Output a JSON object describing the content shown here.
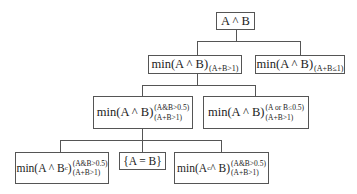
{
  "diagram": {
    "type": "tree",
    "root": {
      "id": "n0",
      "label": "A ^ B"
    },
    "nodes": [
      {
        "id": "n0",
        "main": "A ^ B",
        "sup": "",
        "sub": "",
        "parent": null
      },
      {
        "id": "n1",
        "main": "min(A ^ B)",
        "sup": "",
        "sub": "(A+B>1)",
        "parent": "n0"
      },
      {
        "id": "n2",
        "main": "min(A ^ B)",
        "sup": "",
        "sub": "(A+B≤1)",
        "parent": "n0"
      },
      {
        "id": "n3",
        "main": "min(A ^ B)",
        "sup": "(A&B>0.5)",
        "sub": "(A+B>1)",
        "parent": "n1"
      },
      {
        "id": "n4",
        "main": "min(A ^ B)",
        "sup": "(A or B≤0.5)",
        "sub": "(A+B>1)",
        "parent": "n1"
      },
      {
        "id": "n5",
        "main": "min(A ^ B",
        "main_sup_inline": "c",
        "main_close": ")",
        "sup": "(A&B>0.5)",
        "sub": "(A+B>1)",
        "parent": "n3"
      },
      {
        "id": "n6",
        "main": "{A = B}",
        "sup": "",
        "sub": "",
        "parent": "n3"
      },
      {
        "id": "n7",
        "main_pre": "min(A",
        "main_sup_inline": "c",
        "main_post": " ^ B)",
        "sup": "(A&B>0.5)",
        "sub": "(A+B>1)",
        "parent": "n3"
      }
    ]
  },
  "labels": {
    "n0": "A ^ B",
    "n1_main": "min(A ^ B)",
    "n1_sub": "(A+B>1)",
    "n2_main": "min(A ^ B)",
    "n2_sub": "(A+B≤1)",
    "n3_main": "min(A ^ B)",
    "n3_sup": "(A&B>0.5)",
    "n3_sub": "(A+B>1)",
    "n4_main": "min(A ^ B)",
    "n4_sup": "(A or B≤0.5)",
    "n4_sub": "(A+B>1)",
    "n5_main_pre": "min(A ^ B",
    "n5_main_c": "c",
    "n5_main_post": ")",
    "n5_sup": "(A&B>0.5)",
    "n5_sub": "(A+B>1)",
    "n6": "{A = B}",
    "n7_main_pre": "min(A",
    "n7_main_c": "c",
    "n7_main_post": " ^ B)",
    "n7_sup": "(A&B>0.5)",
    "n7_sub": "(A+B>1)"
  }
}
